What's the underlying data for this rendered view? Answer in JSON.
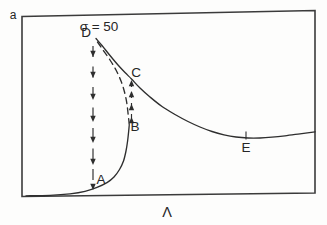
{
  "figure_title": "Response amplitude vs driving parameter (hysteresis jump diagram)",
  "colors": {
    "ink": "#2e2e2e",
    "frame": "#3b3b3b",
    "background": "#fdfdfc",
    "scan_rule": "#8a8a8a"
  },
  "labels": {
    "y_axis": {
      "text": "a",
      "x": 13,
      "y": 19,
      "anchor": "middle"
    },
    "x_axis": {
      "text": "Λ",
      "x": 167,
      "y": 217,
      "anchor": "middle"
    },
    "sigma": {
      "text": "σ = 50",
      "x": 99,
      "y": 31,
      "anchor": "start"
    },
    "A": {
      "text": "A",
      "x": 101,
      "y": 184,
      "anchor": "middle"
    },
    "B": {
      "text": "B",
      "x": 135,
      "y": 131,
      "anchor": "middle"
    },
    "C": {
      "text": "C",
      "x": 136,
      "y": 77,
      "anchor": "middle"
    },
    "D": {
      "text": "D",
      "x": 86,
      "y": 37,
      "anchor": "middle"
    },
    "E": {
      "text": "E",
      "x": 246,
      "y": 152,
      "anchor": "middle"
    }
  },
  "chart_data": {
    "type": "line",
    "title": "",
    "xlabel": "Λ",
    "ylabel": "a",
    "annotation": "σ = 50",
    "axes_numeric": false,
    "grid": false,
    "legend": false,
    "coords": "image pixels, y increases downward",
    "series": [
      {
        "id": "lower_stable",
        "name": "lower stable branch (solid)",
        "dash": "",
        "points": [
          [
            26,
            195.8
          ],
          [
            50,
            195.3
          ],
          [
            70,
            193.8
          ],
          [
            85,
            191.3
          ],
          [
            97,
            187.3
          ],
          [
            107,
            182.6
          ],
          [
            114,
            177
          ],
          [
            119.5,
            169.5
          ],
          [
            123.5,
            161
          ],
          [
            126,
            151
          ],
          [
            127.6,
            141
          ],
          [
            128.6,
            132
          ],
          [
            129.2,
            125.5
          ]
        ]
      },
      {
        "id": "upper_stable",
        "name": "upper stable branch (solid)",
        "dash": "",
        "points": [
          [
            96,
            38.5
          ],
          [
            102,
            45.5
          ],
          [
            110,
            55.5
          ],
          [
            118,
            65
          ],
          [
            125,
            72.5
          ],
          [
            131.5,
            79
          ],
          [
            140,
            88
          ],
          [
            150,
            97
          ],
          [
            162,
            106.5
          ],
          [
            175,
            114.5
          ],
          [
            188,
            121.5
          ],
          [
            200,
            127
          ],
          [
            212,
            131.5
          ],
          [
            224,
            134.8
          ],
          [
            236,
            137
          ],
          [
            248,
            138
          ],
          [
            260,
            138
          ],
          [
            272,
            137.2
          ],
          [
            285,
            135.8
          ],
          [
            300,
            133.8
          ],
          [
            315,
            131.8
          ]
        ]
      },
      {
        "id": "unstable",
        "name": "unstable branch (dashed)",
        "dash": "6,4.5",
        "points": [
          [
            97.5,
            42
          ],
          [
            103,
            50
          ],
          [
            110,
            60
          ],
          [
            116,
            70
          ],
          [
            121,
            81
          ],
          [
            124.5,
            92
          ],
          [
            126.8,
            103
          ],
          [
            128,
            113
          ],
          [
            128.8,
            120
          ],
          [
            129.2,
            124.5
          ]
        ]
      }
    ],
    "jumps": [
      {
        "from": "D",
        "to": "A",
        "direction": "down",
        "x": 93,
        "y_start": 46,
        "y_end": 190,
        "dash": "11,9.5",
        "arrow_ys": [
          57,
          78,
          100,
          122,
          143,
          165,
          190
        ]
      },
      {
        "from": "B",
        "to": "C",
        "direction": "up",
        "x": 131.5,
        "y_start": 120,
        "y_end": 80,
        "dash": "6,5",
        "arrow_ys": [
          117,
          104,
          91,
          80
        ]
      }
    ],
    "marked_points": {
      "A": {
        "x": 93,
        "y": 190,
        "on": "lower stable branch"
      },
      "B": {
        "x": 129,
        "y": 125,
        "on": "lower fold point"
      },
      "C": {
        "x": 131.5,
        "y": 79,
        "on": "upper stable branch"
      },
      "D": {
        "x": 96,
        "y": 39,
        "on": "upper fold point"
      },
      "E": {
        "x": 246,
        "y": 137,
        "on": "upper stable branch"
      }
    },
    "E_tick": {
      "x": 246,
      "y1": 131.5,
      "y2": 139.5
    },
    "frame_polygon": "22,16.5 315,10.5 315,193 22,196.5",
    "scan_rule_y": 3
  }
}
